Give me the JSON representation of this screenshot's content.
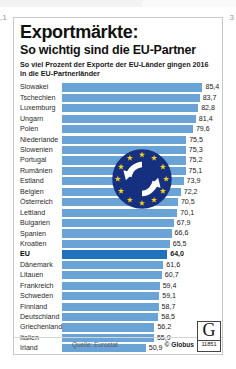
{
  "page_edge": {
    "left_fragment": ",1",
    "right_fragment": "3"
  },
  "header": {
    "title": "Exportmärkte:",
    "subtitle": "So wichtig sind die EU-Partner",
    "lead": "So viel Prozent der Exporte der EU-Länder gingen 2016 in die EU-Partnerländer"
  },
  "footer": {
    "source": "Quelle: Eurostat",
    "copyright": "© Globus",
    "logo_letter": "G",
    "logo_number": "11851"
  },
  "colors": {
    "bar": "#6aa3d5",
    "bar_highlight": "#1f72bb",
    "emblem_blue": "#15307e",
    "emblem_star": "#f5d020",
    "card_border": "#c8c8c8"
  },
  "emblem": {
    "name": "eu-exchange-emblem",
    "stars": 12
  },
  "chart_data": {
    "type": "bar",
    "orientation": "horizontal",
    "title": "Exportmärkte: So wichtig sind die EU-Partner",
    "subtitle": "So viel Prozent der Exporte der EU-Länder gingen 2016 in die EU-Partnerländer",
    "xlabel": "Prozent",
    "ylabel": "",
    "xlim": [
      0,
      90
    ],
    "grid": false,
    "legend": false,
    "unit": "%",
    "highlight_category": "EU",
    "categories": [
      "Slowakei",
      "Tschechien",
      "Luxemburg",
      "Ungarn",
      "Polen",
      "Niederlande",
      "Slowenien",
      "Portugal",
      "Rumänien",
      "Estland",
      "Belgien",
      "Österreich",
      "Lettland",
      "Bulgarien",
      "Spanien",
      "Kroatien",
      "EU",
      "Dänemark",
      "Litauen",
      "Frankreich",
      "Schweden",
      "Finnland",
      "Deutschland",
      "Griechenland",
      "Italien",
      "Irland",
      "Großbritannien",
      "Zypern",
      "Malta"
    ],
    "values": [
      85.4,
      83.7,
      82.8,
      81.4,
      79.6,
      75.5,
      75.3,
      75.2,
      75.1,
      73.9,
      72.2,
      70.5,
      70.1,
      67.9,
      66.6,
      65.5,
      64.0,
      61.6,
      60.7,
      59.4,
      59.1,
      58.7,
      58.5,
      56.2,
      55.9,
      50.9,
      47.5,
      46.4,
      39.1
    ],
    "value_labels": [
      "85,4",
      "83,7",
      "82,8",
      "81,4",
      "79,6",
      "75,5",
      "75,3",
      "75,2",
      "75,1",
      "73,9",
      "72,2",
      "70,5",
      "70,1",
      "67,9",
      "66,6",
      "65,5",
      "64,0",
      "61,6",
      "60,7",
      "59,4",
      "59,1",
      "58,7",
      "58,5",
      "56,2",
      "55,9",
      "50,9",
      "47,5",
      "46,4",
      "39,1"
    ]
  }
}
